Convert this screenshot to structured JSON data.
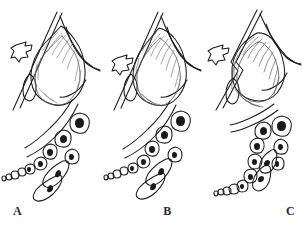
{
  "figure": {
    "type": "line-drawing",
    "background_color": "#ffffff",
    "ink_color": "#1a1a1a",
    "panel_count": 3,
    "panels": [
      {
        "id": "A",
        "label": "A",
        "stage": 1,
        "arrow": {
          "name": "pressure-arrow",
          "direction": "right",
          "style": "hollow-outline"
        },
        "bulb": {
          "name": "follicle-bulb",
          "shading": "light-hatching",
          "compression": "none"
        },
        "cell_chain": {
          "name": "cell-chain",
          "orientation": "diagonal",
          "cell_count": 13
        },
        "surface_line": {
          "name": "surface-line",
          "style": "straight-diagonal"
        }
      },
      {
        "id": "B",
        "label": "B",
        "stage": 2,
        "arrow": {
          "name": "pressure-arrow",
          "direction": "right",
          "style": "hollow-outline"
        },
        "bulb": {
          "name": "follicle-bulb",
          "shading": "medium-hatching",
          "compression": "slight"
        },
        "cell_chain": {
          "name": "cell-chain",
          "orientation": "diagonal",
          "cell_count": 13
        },
        "surface_line": {
          "name": "surface-line",
          "style": "straight-diagonal"
        }
      },
      {
        "id": "C",
        "label": "C",
        "stage": 3,
        "arrow": {
          "name": "pressure-arrow",
          "direction": "right",
          "style": "hollow-outline"
        },
        "bulb": {
          "name": "follicle-bulb",
          "shading": "heavy-hatching",
          "compression": "strong"
        },
        "cell_chain": {
          "name": "cell-chain",
          "orientation": "vertical",
          "cell_count": 13
        },
        "surface_line": {
          "name": "surface-line",
          "style": "kinked-diagonal"
        }
      }
    ]
  }
}
